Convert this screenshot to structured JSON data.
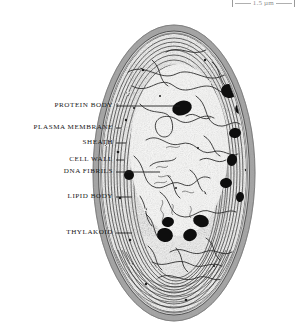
{
  "figure": {
    "specimen": "cyanobacterium cell",
    "image_type": "grayscale electron micrograph",
    "background_color": "#ffffff"
  },
  "scale_bar": {
    "label": "1.5 µm",
    "position": "top-right",
    "color": "#8f8f8f",
    "clipped": true
  },
  "labels": [
    {
      "id": "protein-body",
      "text": "PROTEIN BODY",
      "y": 106,
      "text_right": 113,
      "leader_from": 116,
      "leader_to": 182,
      "leader_y": 106,
      "target": "dark protein body inclusion"
    },
    {
      "id": "plasma-membrane",
      "text": "PLASMA MEMBRANE",
      "y": 128,
      "text_right": 113,
      "leader_from": 116,
      "leader_to": 119,
      "leader_y": 128,
      "target": "inner plasma membrane"
    },
    {
      "id": "sheath",
      "text": "SHEATH",
      "y": 143,
      "text_right": 113,
      "leader_from": 116,
      "leader_to": 125,
      "leader_y": 143,
      "target": "outer mucilage sheath"
    },
    {
      "id": "cell-wall",
      "text": "CELL WALL",
      "y": 160,
      "text_right": 113,
      "leader_from": 116,
      "leader_to": 124,
      "leader_y": 160,
      "target": "cell wall layer"
    },
    {
      "id": "dna-fibrils",
      "text": "DNA FIBRILS",
      "y": 172,
      "text_right": 113,
      "leader_from": 116,
      "leader_to": 158,
      "leader_y": 172,
      "target": "nucleoid DNA fibril region"
    },
    {
      "id": "lipid-body",
      "text": "LIPID BODY",
      "y": 197,
      "text_right": 113,
      "leader_from": 116,
      "leader_to": 130,
      "leader_y": 197,
      "target": "lipid droplet"
    },
    {
      "id": "thylakoid",
      "text": "THYLAKOID",
      "y": 233,
      "text_right": 113,
      "leader_from": 116,
      "leader_to": 130,
      "leader_y": 233,
      "target": "thylakoid membrane stack"
    }
  ],
  "cell": {
    "shape": "ellipse",
    "center_x": 174,
    "center_y": 173,
    "radius_x": 81,
    "radius_y": 148,
    "sheath_color": "#9b9b9b",
    "wall_color": "#8d8d8d",
    "cytoplasm_color": "#f2f2f2",
    "membrane_color": "#3c3c3c",
    "inclusion_color": "#121212"
  },
  "inclusions": [
    {
      "name": "protein-body-upper-left",
      "cx": 182,
      "cy": 108,
      "rx": 10,
      "ry": 7,
      "rot": -18
    },
    {
      "name": "protein-body-upper-right",
      "cx": 229,
      "cy": 91,
      "rx": 8,
      "ry": 7,
      "rot": 12
    },
    {
      "name": "protein-body-right-1",
      "cx": 240,
      "cy": 108,
      "rx": 5,
      "ry": 6,
      "rot": 20
    },
    {
      "name": "protein-body-right-2",
      "cx": 235,
      "cy": 133,
      "rx": 6,
      "ry": 5,
      "rot": -10
    },
    {
      "name": "protein-body-right-3",
      "cx": 232,
      "cy": 160,
      "rx": 5,
      "ry": 6,
      "rot": 15
    },
    {
      "name": "protein-body-right-4",
      "cx": 226,
      "cy": 183,
      "rx": 6,
      "ry": 5,
      "rot": -8
    },
    {
      "name": "protein-body-right-5",
      "cx": 240,
      "cy": 197,
      "rx": 4,
      "ry": 5,
      "rot": 10
    },
    {
      "name": "lipid-body-left",
      "cx": 129,
      "cy": 175,
      "rx": 5,
      "ry": 5,
      "rot": 0
    },
    {
      "name": "lipid-body-lower-1",
      "cx": 168,
      "cy": 222,
      "rx": 6,
      "ry": 5,
      "rot": -12
    },
    {
      "name": "lipid-body-lower-2",
      "cx": 165,
      "cy": 235,
      "rx": 8,
      "ry": 7,
      "rot": 8
    },
    {
      "name": "lipid-body-lower-3",
      "cx": 190,
      "cy": 235,
      "rx": 7,
      "ry": 6,
      "rot": -22
    },
    {
      "name": "lipid-body-lower-4",
      "cx": 201,
      "cy": 221,
      "rx": 8,
      "ry": 6,
      "rot": 18
    }
  ]
}
